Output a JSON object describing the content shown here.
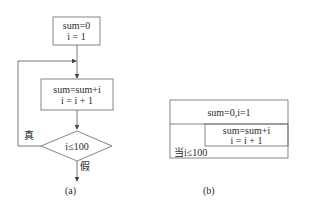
{
  "diagram_a": {
    "init": {
      "line1": "sum=0",
      "line2": "i = 1"
    },
    "body": {
      "line1": "sum=sum+i",
      "line2": "i = i + 1"
    },
    "condition": "i≤100",
    "true_label": "真",
    "false_label": "假",
    "caption": "(a)"
  },
  "diagram_b": {
    "init": "sum=0,i=1",
    "body": {
      "line1": "sum=sum+i",
      "line2": "i = i + 1"
    },
    "loop_condition": "当i≤100",
    "caption": "(b)"
  },
  "colors": {
    "stroke": "#555555",
    "text": "#2a2a2a",
    "background": "#ffffff"
  }
}
